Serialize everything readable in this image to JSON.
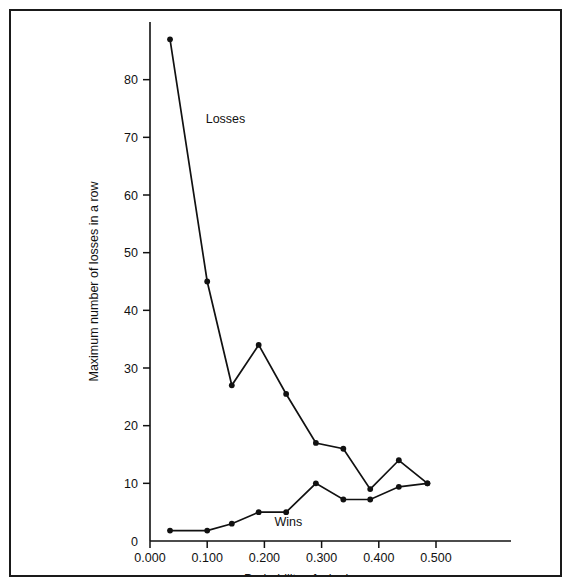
{
  "figure": {
    "border_color": "#1a1a1a",
    "background": "#ffffff",
    "ink_color": "#111111"
  },
  "chart_data": {
    "type": "line",
    "title": "",
    "xlabel": "Probability of  winning",
    "ylabel": "Maximum number of losses in a row",
    "xlim": [
      0.0,
      0.55
    ],
    "ylim": [
      0,
      90
    ],
    "xticks": [
      0.0,
      0.1,
      0.2,
      0.3,
      0.4,
      0.5
    ],
    "xtick_labels": [
      "0.000",
      "0.100",
      "0.200",
      "0.300",
      "0.400",
      "0.500"
    ],
    "yticks": [
      0,
      10,
      20,
      30,
      40,
      50,
      60,
      70,
      80
    ],
    "ytick_labels": [
      "0",
      "10",
      "20",
      "30",
      "40",
      "50",
      "60",
      "70",
      "80"
    ],
    "grid": false,
    "legend": "inline-annotations",
    "series": [
      {
        "name": "Losses",
        "annotation": "Losses",
        "annotation_x": 0.132,
        "annotation_y": 72.5,
        "x": [
          0.035,
          0.1,
          0.143,
          0.19,
          0.238,
          0.29,
          0.338,
          0.385,
          0.435,
          0.485
        ],
        "values": [
          87,
          45,
          27,
          34,
          25.5,
          17,
          16,
          9,
          14,
          10
        ]
      },
      {
        "name": "Wins",
        "annotation": "Wins",
        "annotation_x": 0.242,
        "annotation_y": 2.6,
        "x": [
          0.035,
          0.1,
          0.143,
          0.19,
          0.238,
          0.29,
          0.338,
          0.385,
          0.435,
          0.485
        ],
        "values": [
          1.8,
          1.8,
          3,
          5,
          5,
          10,
          7.2,
          7.2,
          9.4,
          10
        ]
      }
    ]
  }
}
